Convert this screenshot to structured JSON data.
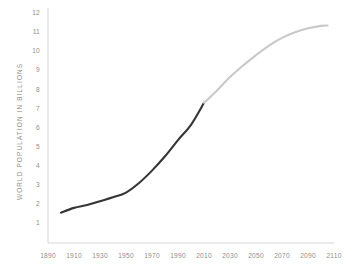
{
  "chart_data": {
    "type": "line",
    "title": "",
    "xlabel": "",
    "ylabel": "WORLD POPULATION IN BILLIONS",
    "xlim": [
      1890,
      2110
    ],
    "ylim": [
      0,
      12
    ],
    "grid": false,
    "legend": "none",
    "x_ticks": [
      "1890",
      "1910",
      "1930",
      "1950",
      "1970",
      "1990",
      "2010",
      "2030",
      "2050",
      "2070",
      "2090",
      "2110"
    ],
    "y_ticks": [
      "1",
      "2",
      "3",
      "4",
      "5",
      "6",
      "7",
      "8",
      "9",
      "10",
      "11",
      "12"
    ],
    "series": [
      {
        "name": "Historical",
        "color": "#353535",
        "x": [
          1900,
          1910,
          1920,
          1930,
          1940,
          1950,
          1960,
          1970,
          1980,
          1990,
          2000,
          2010
        ],
        "values": [
          1.5,
          1.75,
          1.9,
          2.1,
          2.3,
          2.55,
          3.05,
          3.7,
          4.45,
          5.3,
          6.1,
          7.25
        ]
      },
      {
        "name": "Projection",
        "color": "#c9c9c9",
        "x": [
          2010,
          2020,
          2030,
          2040,
          2050,
          2060,
          2070,
          2080,
          2090,
          2100,
          2105
        ],
        "values": [
          7.25,
          7.9,
          8.6,
          9.2,
          9.75,
          10.25,
          10.65,
          10.95,
          11.15,
          11.28,
          11.3
        ]
      }
    ],
    "axis_color": "#d6d6d6",
    "tick_color": "#8e8e8e",
    "background": "#ffffff"
  }
}
